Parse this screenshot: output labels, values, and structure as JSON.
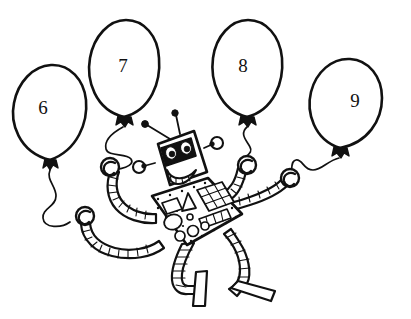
{
  "page": {
    "style": "black and white line drawing",
    "background_color": "#ffffff",
    "ink_color": "#111111",
    "width": 411,
    "height": 319
  },
  "balloons": [
    {
      "id": "balloon-6",
      "number": "6",
      "position": "far-left",
      "label_x": 43,
      "label_y": 110,
      "knot_x": 50,
      "knot_y": 160
    },
    {
      "id": "balloon-7",
      "number": "7",
      "position": "left-center",
      "label_x": 123,
      "label_y": 68,
      "knot_x": 124,
      "knot_y": 117
    },
    {
      "id": "balloon-8",
      "number": "8",
      "position": "right-center",
      "label_x": 243,
      "label_y": 68,
      "knot_x": 247,
      "knot_y": 117
    },
    {
      "id": "balloon-9",
      "number": "9",
      "position": "far-right",
      "label_x": 355,
      "label_y": 103,
      "knot_x": 340,
      "knot_y": 148
    }
  ],
  "robot": {
    "name": "robot",
    "head": {
      "name": "robot-head",
      "features": [
        "eye-band",
        "left-eye",
        "right-eye",
        "toothy-smile"
      ]
    },
    "antennae": [
      {
        "name": "antenna-left",
        "tip": "black-dot"
      },
      {
        "name": "antenna-right",
        "tip": "black-dot"
      }
    ],
    "ears": [
      {
        "name": "ear-left",
        "shape": "knob-on-stalk"
      },
      {
        "name": "ear-right",
        "shape": "knob-on-stalk"
      }
    ],
    "body": {
      "name": "robot-body-panel",
      "controls": [
        {
          "name": "panel-square-button",
          "shape": "square"
        },
        {
          "name": "panel-triangle-button",
          "shape": "triangle"
        },
        {
          "name": "panel-keypad",
          "shape": "grid",
          "rows": 3,
          "cols": 3
        },
        {
          "name": "panel-big-dial",
          "shape": "circle"
        },
        {
          "name": "panel-slider-bank",
          "shape": "row-of-rectangles",
          "count": 4
        },
        {
          "name": "panel-small-dial-a",
          "shape": "circle"
        },
        {
          "name": "panel-small-dial-b",
          "shape": "circle"
        },
        {
          "name": "panel-small-dial-c",
          "shape": "circle"
        },
        {
          "name": "panel-small-dial-d",
          "shape": "circle"
        }
      ],
      "rivets": "dotted border"
    },
    "arms": [
      {
        "name": "arm-left",
        "style": "segmented-tube",
        "hand": "hook-left"
      },
      {
        "name": "arm-right",
        "style": "segmented-tube",
        "hand": "hook-right"
      }
    ],
    "hooks": [
      {
        "name": "hook-upper-left",
        "holds": "balloon-7 string"
      },
      {
        "name": "hook-lower-left",
        "holds": "balloon-6 string"
      },
      {
        "name": "hook-upper-right",
        "holds": "balloon-8 string"
      },
      {
        "name": "hook-lower-right",
        "holds": "balloon-9 string"
      }
    ],
    "legs": [
      {
        "name": "leg-left",
        "style": "segmented-tube",
        "foot": "foot-left"
      },
      {
        "name": "leg-right",
        "style": "segmented-tube",
        "foot": "foot-right"
      }
    ]
  },
  "caption": {
    "text": "",
    "note": "cut-off line of faint text at the very bottom edge"
  }
}
